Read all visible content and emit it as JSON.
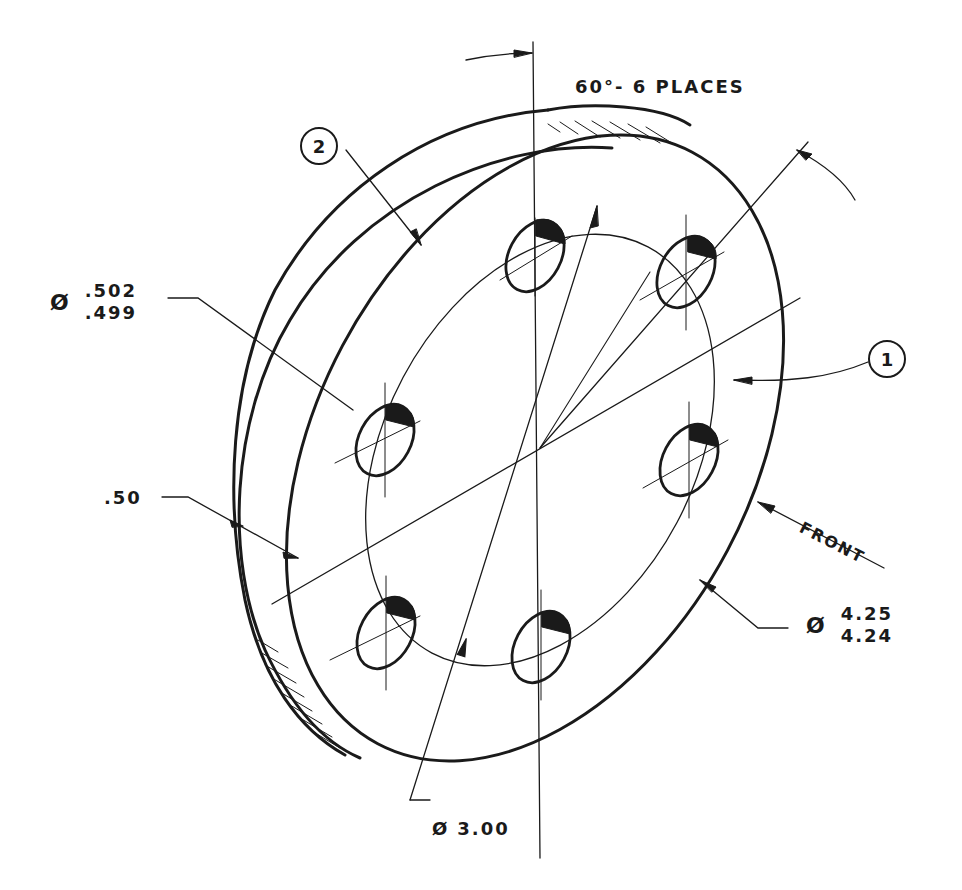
{
  "drawing": {
    "title": "Isometric flange with 6-hole bolt circle",
    "angle_note": {
      "text": "60°- 6 PLACES"
    },
    "hole_diameter": {
      "symbol": "Ø",
      "upper": ".502",
      "lower": ".499"
    },
    "thickness": {
      "value": ".50"
    },
    "outer_diameter": {
      "symbol": "Ø",
      "upper": "4.25",
      "lower": "4.24"
    },
    "bolt_circle_diameter": {
      "symbol": "Ø",
      "value": "3.00"
    },
    "view_direction": {
      "text": "FRONT"
    },
    "balloons": [
      {
        "id": "1",
        "label": "1"
      },
      {
        "id": "2",
        "label": "2"
      }
    ],
    "hole_count": 6,
    "colors": {
      "ink": "#1a1a1a",
      "paper": "#ffffff"
    }
  }
}
